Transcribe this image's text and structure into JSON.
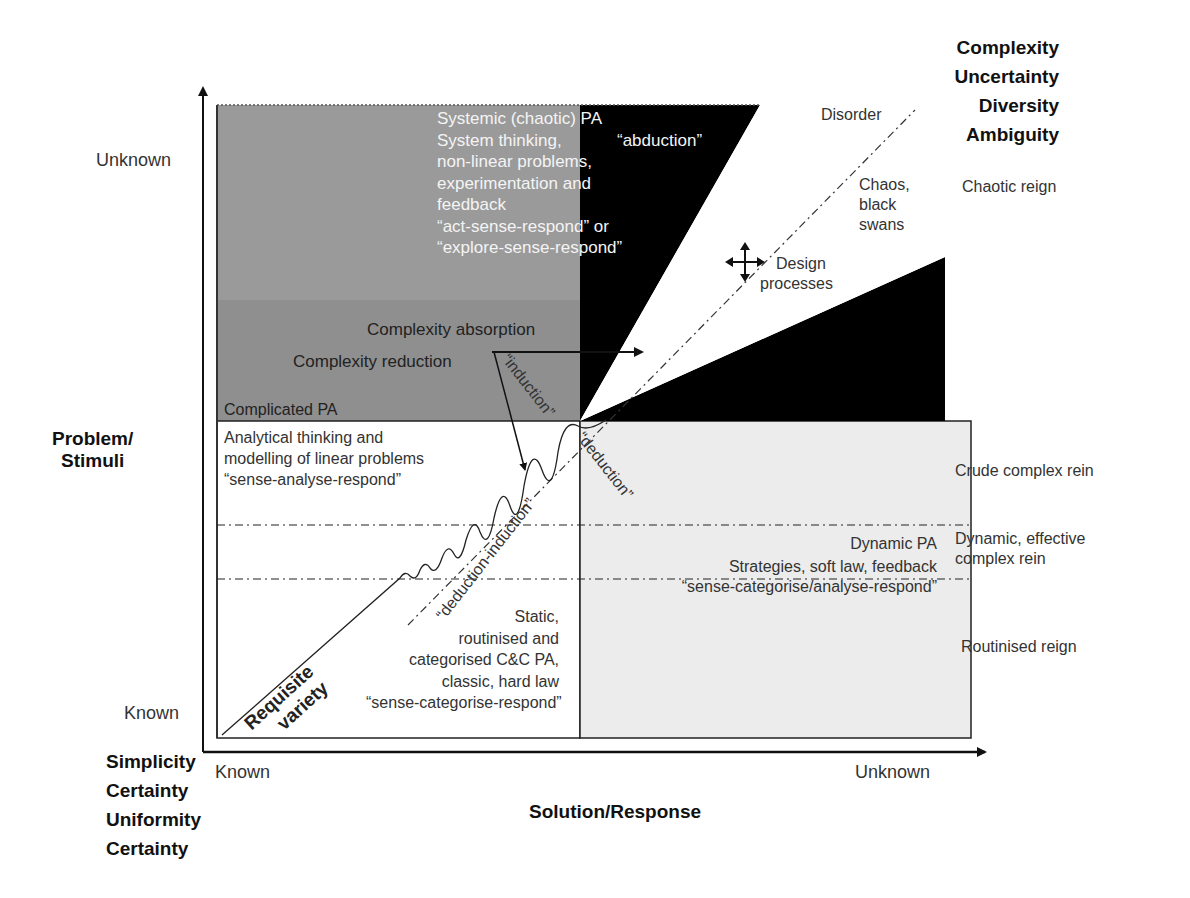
{
  "axes": {
    "y_axis_title": [
      "Problem/",
      "Stimuli"
    ],
    "x_axis_title": "Solution/Response",
    "y_unknown": "Unknown",
    "y_known": "Known",
    "x_known": "Known",
    "x_unknown": "Unknown",
    "top_right_dimensions": [
      "Complexity",
      "Uncertainty",
      "Diversity",
      "Ambiguity"
    ],
    "bottom_left_dimensions": [
      "Simplicity",
      "Certainty",
      "Uniformity",
      "Certainty"
    ]
  },
  "regions": {
    "systemic": {
      "lines": [
        "Systemic (chaotic) PA",
        "System thinking,",
        "non-linear problems,",
        "experimentation and",
        "feedback",
        "“act-sense-respond” or",
        "“explore-sense-respond”"
      ],
      "abduction": "“abduction”"
    },
    "complicated": {
      "title": "Complicated PA",
      "lines": [
        "Analytical thinking and",
        "modelling of linear problems",
        "“sense-analyse-respond”"
      ]
    },
    "static": {
      "lines": [
        "Static,",
        "routinised and",
        "categorised C&C PA,",
        "classic, hard law",
        "“sense-categorise-respond”"
      ]
    },
    "dynamic": {
      "lines": [
        "Dynamic PA",
        "Strategies, soft law, feedback",
        "“sense-categorise/analyse-respond”"
      ]
    },
    "complexity_absorption": "Complexity absorption",
    "complexity_reduction": "Complexity reduction",
    "induction": "“induction”",
    "deduction": "“deduction”",
    "deduction_induction": "“deduction-induction”",
    "requisite_variety": [
      "Requisite",
      "variety"
    ],
    "disorder": "Disorder",
    "chaos": [
      "Chaos,",
      "black",
      "swans"
    ],
    "design_processes": [
      "Design",
      "processes"
    ]
  },
  "reigns": {
    "chaotic": "Chaotic reign",
    "crude_complex": "Crude complex rein",
    "dynamic_effective": [
      "Dynamic, effective",
      "complex rein"
    ],
    "routinised": "Routinised reign"
  },
  "colors": {
    "systemic_fill": "#9a9a9a",
    "complicated_fill": "#8e8e8e",
    "dynamic_fill": "#ececec",
    "black_wedge": "#000000",
    "line": "#222222"
  }
}
